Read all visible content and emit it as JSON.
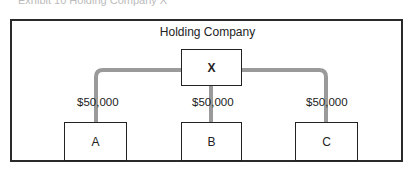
{
  "caption": "Exhibit 10 Holding Company X",
  "diagram": {
    "title": "Holding Company",
    "parent": {
      "label": "X"
    },
    "subsidiaries": [
      {
        "label": "A",
        "amount": "$50,000"
      },
      {
        "label": "B",
        "amount": "$50,000"
      },
      {
        "label": "C",
        "amount": "$50,000"
      }
    ],
    "colors": {
      "connector": "#9a9a9a",
      "border": "#222222"
    }
  }
}
